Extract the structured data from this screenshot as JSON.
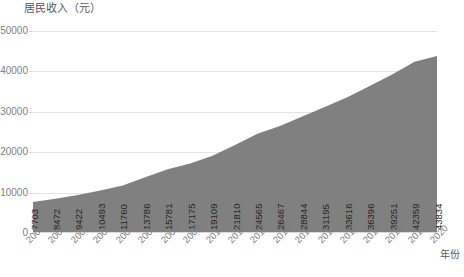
{
  "chart_data": {
    "type": "area",
    "title": "居民收入（元）",
    "xlabel": "年份",
    "ylabel": "",
    "categories": [
      "2002",
      "2003",
      "2004",
      "2005",
      "2006",
      "2007",
      "2008",
      "2009",
      "2010",
      "2011",
      "2012",
      "2013",
      "2014",
      "2015",
      "2016",
      "2017",
      "2018",
      "2019",
      "2020"
    ],
    "values": [
      7703,
      8472,
      9422,
      10493,
      11760,
      13786,
      15781,
      17175,
      19109,
      21810,
      24565,
      26467,
      28844,
      31195,
      33616,
      36396,
      39251,
      42359,
      43834
    ],
    "ylim": [
      0,
      50000
    ],
    "yticks": [
      "0",
      "10000",
      "20000",
      "30000",
      "40000",
      "50000"
    ],
    "ytick_values": [
      0,
      10000,
      20000,
      30000,
      40000,
      50000
    ],
    "grid": true,
    "legend": "none",
    "series_color": "#808080",
    "grid_color": "#e4e4e4",
    "axis_color": "#d9d9d9",
    "label_color": "#7f7f7f",
    "value_label_color": "#262626",
    "title_color": "#595959"
  }
}
